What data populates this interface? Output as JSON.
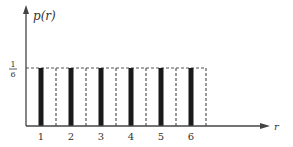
{
  "chart_data": {
    "type": "bar",
    "title": "",
    "xlabel": "r",
    "ylabel": "p(r)",
    "categories": [
      "1",
      "2",
      "3",
      "4",
      "5",
      "6"
    ],
    "values": [
      0.1667,
      0.1667,
      0.1667,
      0.1667,
      0.1667,
      0.1667
    ],
    "y_tick_labels": [
      {
        "numerator": "1",
        "denominator": "6",
        "value": 0.1667
      }
    ],
    "ylim": [
      0,
      0.28
    ],
    "grid": false,
    "legend": null,
    "annotations": [
      "Dashed boxes of unit width and height 1/6 around each bar, representing uniform probability"
    ],
    "colors": {
      "bar": "#1a1a1a",
      "axis": "#444444",
      "dash": "#555555"
    }
  }
}
